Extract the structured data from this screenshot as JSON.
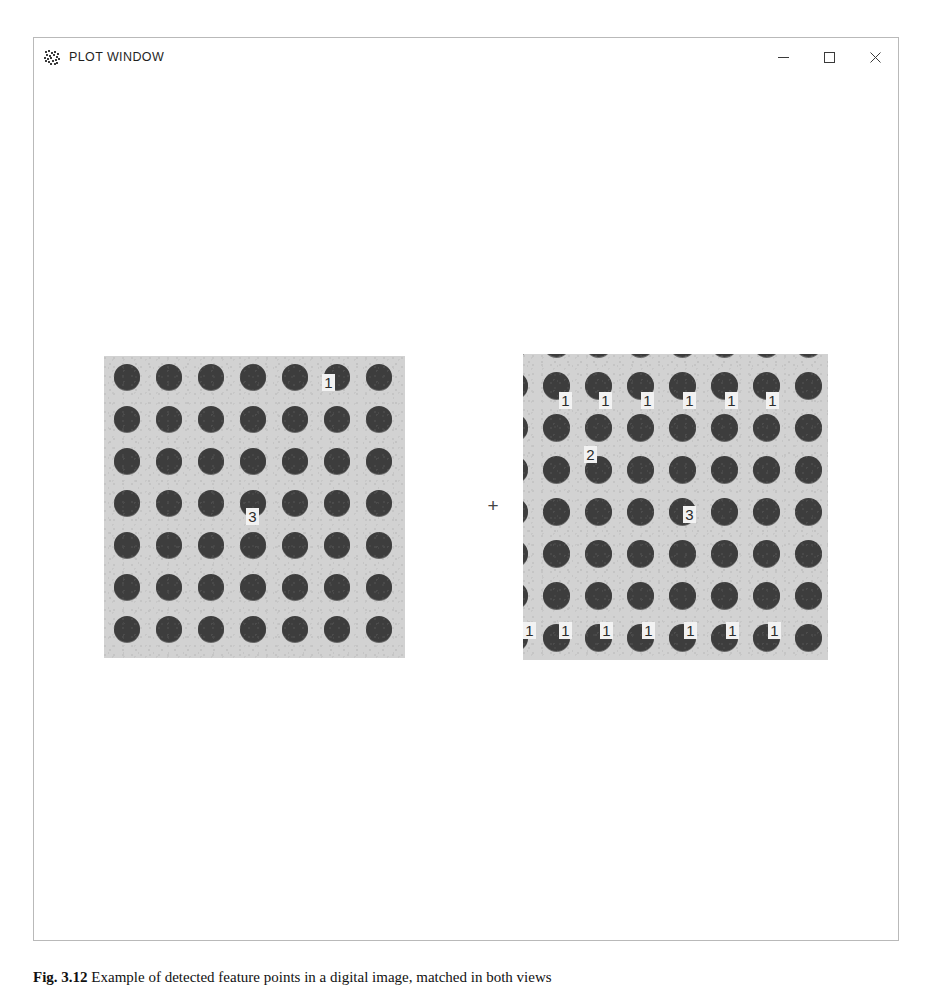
{
  "window": {
    "title": "PLOT WINDOW",
    "icon": "scattered-dots-icon",
    "controls": {
      "minimize": "–",
      "maximize": "□",
      "close": "✕"
    }
  },
  "plot": {
    "operator": "+",
    "background": "#ffffff",
    "panel_bg": "#d2d2d2",
    "dot_color": "#3d3d3d",
    "marker_bg": "#f2f2f2",
    "marker_fg": "#2b2b2b",
    "left_panel": {
      "name": "reference-dot-grid",
      "rows": 7,
      "cols": 7,
      "markers": [
        {
          "label": "1",
          "x": 218,
          "y": 18
        },
        {
          "label": "3",
          "x": 142,
          "y": 152
        }
      ]
    },
    "right_panel": {
      "name": "shifted-dot-grid",
      "rows": 8,
      "cols": 8,
      "markers": [
        {
          "label": "1",
          "x": 36,
          "y": 38
        },
        {
          "label": "1",
          "x": 76,
          "y": 38
        },
        {
          "label": "1",
          "x": 118,
          "y": 38
        },
        {
          "label": "1",
          "x": 160,
          "y": 38
        },
        {
          "label": "1",
          "x": 202,
          "y": 38
        },
        {
          "label": "1",
          "x": 243,
          "y": 38
        },
        {
          "label": "2",
          "x": 61,
          "y": 92
        },
        {
          "label": "3",
          "x": 160,
          "y": 152
        },
        {
          "label": "1",
          "x": 0,
          "y": 268
        },
        {
          "label": "1",
          "x": 36,
          "y": 268
        },
        {
          "label": "1",
          "x": 77,
          "y": 268
        },
        {
          "label": "1",
          "x": 119,
          "y": 268
        },
        {
          "label": "1",
          "x": 161,
          "y": 268
        },
        {
          "label": "1",
          "x": 203,
          "y": 268
        },
        {
          "label": "1",
          "x": 245,
          "y": 268
        }
      ]
    }
  },
  "caption": {
    "figure_number": "Fig. 3.12",
    "text": "Example of detected feature points in a digital image, matched in both views"
  }
}
